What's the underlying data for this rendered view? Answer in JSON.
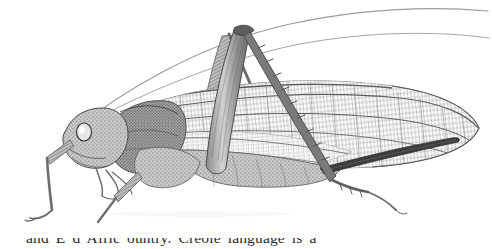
{
  "page": {
    "background_color": "#ffffff",
    "width": 492,
    "height": 249,
    "medium": "grayscale stipple-and-line scientific engraving on white paper"
  },
  "figure": {
    "name": "katydid-illustration",
    "subject": "Katydid (bush-cricket), female, left lateral view",
    "order": "Orthoptera",
    "family": "Tettigoniidae",
    "orientation": "facing left, wings folded over abdomen, hind leg raised in inverted V",
    "ink_color": "#6e6e6e",
    "dark_ink_color": "#3a3a3a",
    "light_ink_color": "#b9b9b9",
    "parts": [
      {
        "label": "antenna-left",
        "note": "very long filiform antenna sweeping up and right across the plate"
      },
      {
        "label": "antenna-right",
        "note": "second filiform antenna, slightly lower arc"
      },
      {
        "label": "head",
        "note": "rounded head with large pale compound eye"
      },
      {
        "label": "compound-eye",
        "note": "oval, light with dark rim"
      },
      {
        "label": "pronotum",
        "note": "saddle-shaped shield behind the head"
      },
      {
        "label": "foreleg",
        "note": "slender front leg reaching down-left"
      },
      {
        "label": "midleg",
        "note": "middle leg angled forward and down"
      },
      {
        "label": "hind-femur",
        "note": "thick muscular femur rising steeply"
      },
      {
        "label": "hind-tibia",
        "note": "long spined tibia descending to the right"
      },
      {
        "label": "hind-tarsus",
        "note": "small segmented foot with claws"
      },
      {
        "label": "tegmen",
        "note": "long leathery forewing with dense reticulate venation"
      },
      {
        "label": "wing-venation",
        "note": "fine cross-hatched cell network across the whole wing"
      },
      {
        "label": "abdomen",
        "note": "segmented body hidden mostly beneath the wing"
      },
      {
        "label": "ovipositor",
        "note": "dark slender sword-shaped blade projecting back to the right"
      }
    ]
  },
  "caption": {
    "name": "page-body-text",
    "visible_fragment": "and E          d Afric      ountry. Creole language is a",
    "note": "only the ascender tops of one line of book text are visible at the cut bottom edge"
  }
}
